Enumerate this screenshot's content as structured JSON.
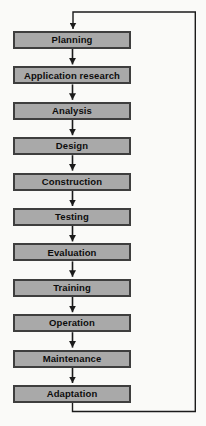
{
  "diagram": {
    "type": "flowchart",
    "stages": [
      "Planning",
      "Application research",
      "Analysis",
      "Design",
      "Construction",
      "Testing",
      "Evaluation",
      "Training",
      "Operation",
      "Maintenance",
      "Adaptation"
    ],
    "connections": [
      {
        "from": "Planning",
        "to": "Application research",
        "type": "arrow-down"
      },
      {
        "from": "Application research",
        "to": "Analysis",
        "type": "arrow-down"
      },
      {
        "from": "Analysis",
        "to": "Design",
        "type": "arrow-down"
      },
      {
        "from": "Design",
        "to": "Construction",
        "type": "arrow-down"
      },
      {
        "from": "Construction",
        "to": "Testing",
        "type": "arrow-down"
      },
      {
        "from": "Testing",
        "to": "Evaluation",
        "type": "arrow-down"
      },
      {
        "from": "Evaluation",
        "to": "Training",
        "type": "arrow-down"
      },
      {
        "from": "Training",
        "to": "Operation",
        "type": "arrow-down"
      },
      {
        "from": "Operation",
        "to": "Maintenance",
        "type": "arrow-down"
      },
      {
        "from": "Maintenance",
        "to": "Adaptation",
        "type": "arrow-down"
      },
      {
        "from": "Adaptation",
        "to": "Planning",
        "type": "feedback-loop-right-side"
      }
    ],
    "colors": {
      "box_fill": "#a9a9a9",
      "box_border": "#3e3e3e",
      "connector": "#1b1b1b",
      "background": "#fafaf8"
    }
  }
}
